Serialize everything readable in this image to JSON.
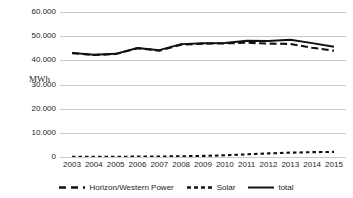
{
  "chart_data": {
    "type": "line",
    "title": "",
    "xlabel": "",
    "ylabel": "MWh",
    "x": [
      2003,
      2004,
      2005,
      2006,
      2007,
      2008,
      2009,
      2010,
      2011,
      2012,
      2013,
      2014,
      2015
    ],
    "categories": [
      "2003",
      "2004",
      "2005",
      "2006",
      "2007",
      "2008",
      "2009",
      "2010",
      "2011",
      "2012",
      "2013",
      "2014",
      "2015"
    ],
    "ylim": [
      0,
      60000
    ],
    "ytick_labels": [
      "60.000",
      "50.000",
      "40.000",
      "30.000",
      "20.000",
      "10.000",
      "0"
    ],
    "ytick_values": [
      60000,
      50000,
      40000,
      30000,
      20000,
      10000,
      0
    ],
    "grid": true,
    "legend_position": "bottom",
    "series": [
      {
        "name": "Horizon/Western Power",
        "style": "long-dash",
        "color": "#111111",
        "values": [
          43000,
          42200,
          42600,
          45000,
          44000,
          46500,
          46900,
          47000,
          47300,
          46900,
          46800,
          45200,
          44000
        ]
      },
      {
        "name": "Solar",
        "style": "short-dash",
        "color": "#111111",
        "values": [
          60,
          80,
          110,
          150,
          200,
          300,
          450,
          700,
          1100,
          1500,
          1800,
          2000,
          2100
        ]
      },
      {
        "name": "total",
        "style": "solid",
        "color": "#111111",
        "values": [
          43100,
          42300,
          42700,
          45100,
          44200,
          46700,
          47100,
          47200,
          48100,
          48000,
          48500,
          47100,
          45600
        ]
      }
    ]
  },
  "legend": {
    "items": [
      {
        "label": "Horizon/Western Power",
        "style": "long-dash"
      },
      {
        "label": "Solar",
        "style": "short-dash"
      },
      {
        "label": "total",
        "style": "solid"
      }
    ]
  }
}
